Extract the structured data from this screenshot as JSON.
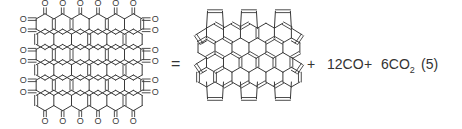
{
  "equation": {
    "reactant": {
      "name": "oxidized-graphene-flake",
      "oxygen_label": "O",
      "hex_columns": 6,
      "hex_rows": 6
    },
    "equals": "=",
    "product": {
      "name": "cyclopenta-fused-graphene-flake",
      "pentagons_top": 3,
      "pentagons_bottom": 3,
      "pentagons_side": 4
    },
    "plus_1": "+",
    "byproduct_1": {
      "coefficient": "12",
      "formula": "CO"
    },
    "plus_2": "+",
    "byproduct_2": {
      "coefficient": "6",
      "formula": "CO",
      "subscript": "2"
    },
    "equation_number": "(5)"
  },
  "colors": {
    "line": "#3a3a3a",
    "text": "#333333",
    "background": "#ffffff"
  }
}
